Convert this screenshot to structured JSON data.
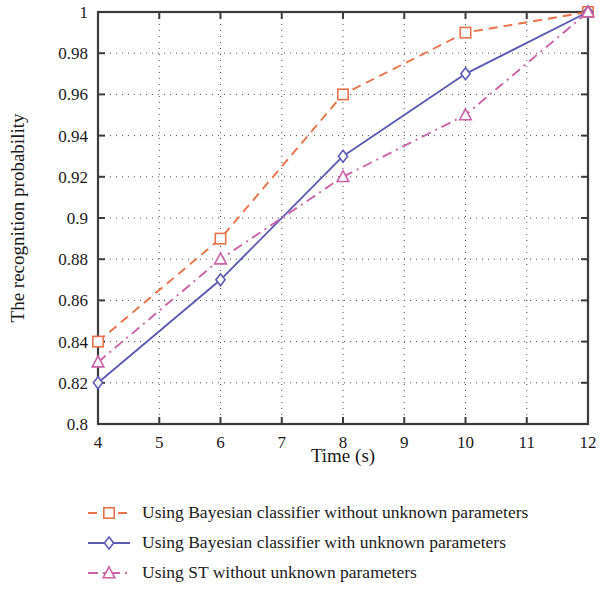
{
  "chart_data": {
    "type": "line",
    "title": "",
    "xlabel": "Time (s)",
    "ylabel": "The recognition probability",
    "x": [
      4,
      6,
      8,
      10,
      12
    ],
    "xlim": [
      4,
      12
    ],
    "ylim": [
      0.8,
      1.0
    ],
    "xticks": [
      "4",
      "5",
      "6",
      "7",
      "8",
      "9",
      "10",
      "11",
      "12"
    ],
    "xtick_values": [
      4,
      5,
      6,
      7,
      8,
      9,
      10,
      11,
      12
    ],
    "yticks": [
      "0.8",
      "0.82",
      "0.84",
      "0.86",
      "0.88",
      "0.9",
      "0.92",
      "0.94",
      "0.96",
      "0.98",
      "1"
    ],
    "ytick_values": [
      0.8,
      0.82,
      0.84,
      0.86,
      0.88,
      0.9,
      0.92,
      0.94,
      0.96,
      0.98,
      1.0
    ],
    "grid": true,
    "grid_style": "dotted",
    "legend_position": "below",
    "series": [
      {
        "name": "Using Bayesian classifier without unknown parameters",
        "values": [
          0.84,
          0.89,
          0.96,
          0.99,
          1.0
        ],
        "color": "#e8724a",
        "line_style": "dashed",
        "marker": "square"
      },
      {
        "name": "Using Bayesian classifier with unknown parameters",
        "values": [
          0.82,
          0.87,
          0.93,
          0.97,
          1.0
        ],
        "color": "#5b5bb5",
        "line_style": "solid",
        "marker": "diamond"
      },
      {
        "name": "Using ST without unknown parameters",
        "values": [
          0.83,
          0.88,
          0.92,
          0.95,
          1.0
        ],
        "color": "#cc62a8",
        "line_style": "dashdot",
        "marker": "triangle"
      }
    ]
  },
  "legend": {
    "items": [
      {
        "label": "Using Bayesian classifier without unknown parameters"
      },
      {
        "label": "Using Bayesian classifier with unknown parameters"
      },
      {
        "label": "Using ST without unknown parameters"
      }
    ]
  },
  "colors": {
    "orange": "#e8724a",
    "blue": "#5b5bb5",
    "pink": "#cc62a8",
    "axis": "#3b3b3b",
    "grid": "#4d4d4d",
    "text": "#1a1a1a",
    "background": "#ffffff"
  }
}
